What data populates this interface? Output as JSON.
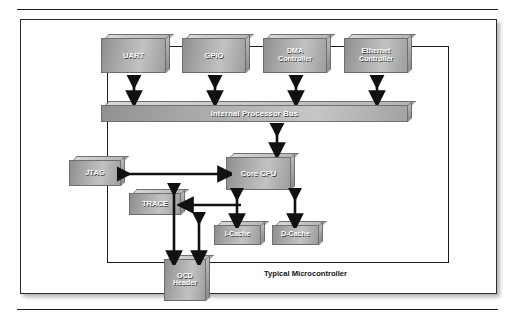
{
  "figure": {
    "caption": "Typical Microcontroller",
    "chip_boundary_label": "Typical Microcontroller",
    "colors": {
      "block_fill_light": "#c2c2c2",
      "block_fill_dark": "#8e8e8e",
      "block_border": "#6f6f6f",
      "block_text": "#ffffff",
      "line": "#111111",
      "panel_border": "#2b2b2b",
      "background": "#ffffff"
    }
  },
  "diagram": {
    "type": "block-diagram",
    "title": "Typical Microcontroller",
    "peripherals": [
      {
        "id": "uart",
        "label": "UART",
        "lines": [
          "UART"
        ]
      },
      {
        "id": "gpio",
        "label": "GPIO",
        "lines": [
          "GPIO"
        ]
      },
      {
        "id": "dma",
        "label": "DMA Controller",
        "lines": [
          "DMA",
          "Controller"
        ]
      },
      {
        "id": "ethernet",
        "label": "Ethernet Controller",
        "lines": [
          "Ethernet",
          "Controller"
        ]
      }
    ],
    "bus": {
      "id": "bus",
      "label": "Internal Processor Bus"
    },
    "core": [
      {
        "id": "jtag",
        "label": "JTAG",
        "lines": [
          "JTAG"
        ]
      },
      {
        "id": "cpu",
        "label": "Core CPU",
        "lines": [
          "Core CPU"
        ]
      },
      {
        "id": "trace",
        "label": "TRACE",
        "lines": [
          "TRACE"
        ]
      },
      {
        "id": "icache",
        "label": "I-Cache",
        "lines": [
          "I-Cache"
        ]
      },
      {
        "id": "dcache",
        "label": "D-Cache",
        "lines": [
          "D-Cache"
        ]
      }
    ],
    "external": [
      {
        "id": "ocd",
        "label": "OCD Header",
        "lines": [
          "OCD",
          "Header"
        ]
      }
    ],
    "connections": [
      {
        "from": "uart",
        "to": "bus",
        "style": "double",
        "orientation": "vertical"
      },
      {
        "from": "gpio",
        "to": "bus",
        "style": "double",
        "orientation": "vertical"
      },
      {
        "from": "dma",
        "to": "bus",
        "style": "double",
        "orientation": "vertical"
      },
      {
        "from": "ethernet",
        "to": "bus",
        "style": "double",
        "orientation": "vertical"
      },
      {
        "from": "bus",
        "to": "cpu",
        "style": "double",
        "orientation": "vertical"
      },
      {
        "from": "jtag",
        "to": "cpu",
        "style": "double",
        "orientation": "horizontal"
      },
      {
        "from": "cpu",
        "to": "trace",
        "style": "single",
        "orientation": "horizontal"
      },
      {
        "from": "cpu",
        "to": "icache",
        "style": "double",
        "orientation": "vertical"
      },
      {
        "from": "cpu",
        "to": "dcache",
        "style": "double",
        "orientation": "vertical"
      },
      {
        "from": "jtag",
        "to": "ocd",
        "style": "double",
        "orientation": "vertical"
      },
      {
        "from": "trace",
        "to": "ocd",
        "style": "double",
        "orientation": "vertical"
      }
    ]
  }
}
